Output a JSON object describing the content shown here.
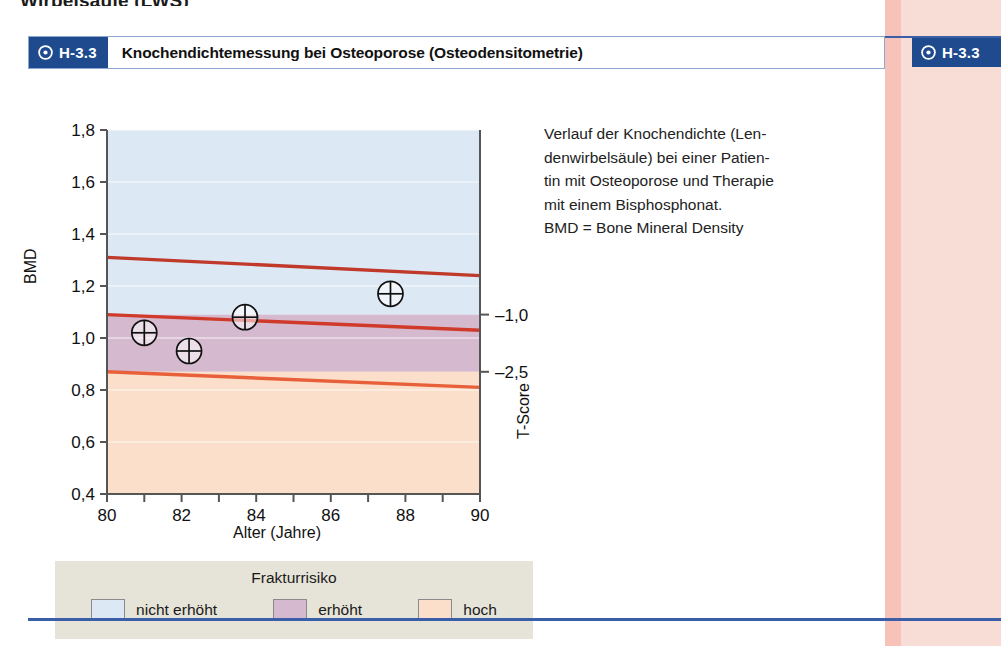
{
  "page": {
    "top_cut_text": "Wirbelsäule (LWS)",
    "accent_blue": "#1f4b8e",
    "rule_blue": "#3a5ea8",
    "margin_pink": "#f8ddd7",
    "margin_stripe": "#f7c3b8"
  },
  "figure": {
    "badge_label": "H-3.3",
    "badge_icon": "circled-dot-icon",
    "title": "Knochendichtemessung bei Osteoporose (Osteodensitometrie)"
  },
  "margin_tab": {
    "label": "H-3.3",
    "icon": "circled-dot-icon"
  },
  "caption": {
    "lines": [
      "Verlauf der Knochendichte (Len-",
      "denwirbelsäule) bei einer Patien-",
      "tin mit Osteoporose und Therapie",
      "mit einem Bisphosphonat.",
      "BMD = Bone Mineral Density"
    ]
  },
  "legend": {
    "title": "Frakturrisiko",
    "items": [
      {
        "label": "nicht erhöht",
        "color": "#dce9f4"
      },
      {
        "label": "erhöht",
        "color": "#d5b9ce"
      },
      {
        "label": "hoch",
        "color": "#fbdfcb"
      }
    ]
  },
  "chart_data": {
    "type": "scatter",
    "title": "Knochendichtemessung bei Osteoporose (Osteodensitometrie)",
    "xlabel": "Alter (Jahre)",
    "ylabel": "BMD",
    "y2label": "T-Score",
    "xlim": [
      80,
      90
    ],
    "ylim": [
      0.4,
      1.8
    ],
    "xticks": [
      80,
      81,
      82,
      83,
      84,
      85,
      86,
      87,
      88,
      89,
      90
    ],
    "xticklabels": [
      "80",
      "",
      "82",
      "",
      "84",
      "",
      "86",
      "",
      "88",
      "",
      "90"
    ],
    "yticks": [
      0.4,
      0.6,
      0.8,
      1.0,
      1.2,
      1.4,
      1.6,
      1.8
    ],
    "yticklabels": [
      "0,4",
      "0,6",
      "0,8",
      "1,0",
      "1,2",
      "1,4",
      "1,6",
      "1,8"
    ],
    "y2ticks": [
      1.09,
      0.87
    ],
    "y2ticklabels": [
      "–1,0",
      "–2,5"
    ],
    "grid": false,
    "legend_position": "below-plot",
    "series": [
      {
        "name": "Messwerte",
        "type": "scatter",
        "marker": "crossed-circle",
        "points": [
          {
            "x": 81.0,
            "y": 1.02
          },
          {
            "x": 82.2,
            "y": 0.95
          },
          {
            "x": 83.7,
            "y": 1.08
          },
          {
            "x": 87.6,
            "y": 1.17
          }
        ]
      },
      {
        "name": "obere Grenzlinie",
        "type": "line",
        "color": "#c0392b",
        "x": [
          80,
          90
        ],
        "y": [
          1.31,
          1.24
        ]
      },
      {
        "name": "T-Score –1,0 Grenzlinie",
        "type": "line",
        "color": "#cf3a2a",
        "x": [
          80,
          90
        ],
        "y": [
          1.09,
          1.03
        ]
      },
      {
        "name": "T-Score –2,5 Grenzlinie",
        "type": "line",
        "color": "#e8603a",
        "x": [
          80,
          90
        ],
        "y": [
          0.87,
          0.81
        ]
      }
    ],
    "bands": [
      {
        "name": "nicht erhöht",
        "color": "#dce9f4",
        "from": 1.09,
        "to": 1.8
      },
      {
        "name": "erhöht",
        "color": "#d5b9ce",
        "from": 0.87,
        "to": 1.09
      },
      {
        "name": "hoch",
        "color": "#fbdfcb",
        "from": 0.4,
        "to": 0.87
      }
    ]
  }
}
